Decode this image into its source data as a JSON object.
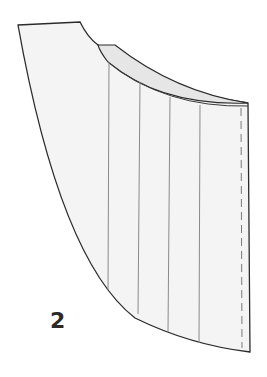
{
  "figure": {
    "label": "2",
    "colors": {
      "outline": "#2b2b2b",
      "fill": "#f3f3f3",
      "fold_fill": "#e6e6e6",
      "pleat_line": "#8a8a8a",
      "dashed_line": "#7a7a7a"
    }
  }
}
